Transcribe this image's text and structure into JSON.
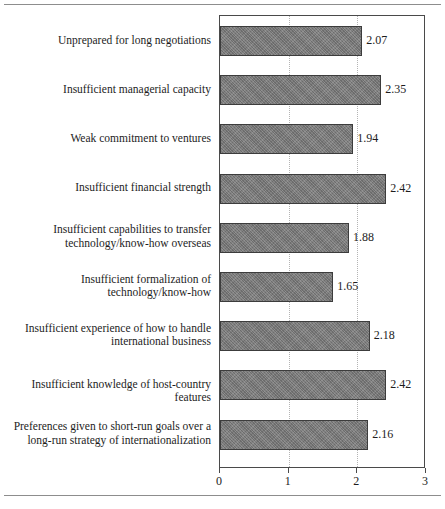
{
  "chart_data": {
    "type": "bar",
    "orientation": "horizontal",
    "title": "",
    "subtitle": "",
    "xlabel": "",
    "ylabel": "",
    "xlim": [
      0,
      3
    ],
    "ylim": null,
    "grid": "vertical dotted gridlines at x = 1 and x = 2",
    "legend": null,
    "legend_position": "none",
    "xticks": [
      "0",
      "1",
      "2",
      "3"
    ],
    "xtick_values": [
      0,
      1,
      2,
      3
    ],
    "categories": [
      "Unprepared for long negotiations",
      "Insufficient managerial capacity",
      "Weak commitment to ventures",
      "Insufficient financial strength",
      "Insufficient capabilities to transfer technology/know-how overseas",
      "Insufficient formalization of technology/know-how",
      "Insufficient experience of how to handle international business",
      "Insufficient knowledge of host-country features",
      "Preferences given to short-run goals over a long-run strategy of internationalization"
    ],
    "values": [
      2.07,
      2.35,
      1.94,
      2.42,
      1.88,
      1.65,
      2.18,
      2.42,
      2.16
    ],
    "value_labels": [
      "2.07",
      "2.35",
      "1.94",
      "2.42",
      "1.88",
      "1.65",
      "2.18",
      "2.42",
      "2.16"
    ],
    "bar_color": "#7d7d7d",
    "bar_border_color": "#3c3c3c",
    "gridline_color": "#b4b4b4",
    "axis_color": "#4a4a4a",
    "text_color": "#1d1d1d"
  },
  "labels": [
    {
      "line1": "Unprepared for long negotiations",
      "line2": ""
    },
    {
      "line1": "Insufficient managerial capacity",
      "line2": ""
    },
    {
      "line1": "Weak commitment to ventures",
      "line2": ""
    },
    {
      "line1": "Insufficient financial strength",
      "line2": ""
    },
    {
      "line1": "Insufficient capabilities to transfer",
      "line2": "technology/know-how overseas"
    },
    {
      "line1": "Insufficient formalization of",
      "line2": "technology/know-how"
    },
    {
      "line1": "Insufficient experience of how to handle",
      "line2": "international business"
    },
    {
      "line1": "Insufficient knowledge of host-country features",
      "line2": ""
    },
    {
      "line1": "Preferences given to short-run goals over a",
      "line2": "long-run strategy of internationalization"
    }
  ],
  "axis": {
    "ticks": [
      "0",
      "1",
      "2",
      "3"
    ]
  }
}
